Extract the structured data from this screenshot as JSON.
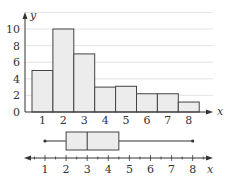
{
  "chart_data": [
    {
      "type": "bar",
      "subtype": "histogram",
      "title": "",
      "xlabel": "x",
      "ylabel": "y",
      "categories": [
        "1",
        "2",
        "3",
        "4",
        "5",
        "6",
        "7",
        "8"
      ],
      "values": [
        5,
        10,
        7,
        3,
        3.1,
        2.2,
        2.2,
        1.2
      ],
      "ylim": [
        0,
        12
      ],
      "yticks": [
        0,
        2,
        4,
        6,
        8,
        10
      ],
      "grid": true,
      "legend": null
    },
    {
      "type": "boxplot",
      "xlabel": "x",
      "min": 1,
      "q1": 2,
      "median": 3,
      "q3": 4.5,
      "max": 8,
      "xticks": [
        1,
        2,
        3,
        4,
        5,
        6,
        7,
        8
      ],
      "xlim": [
        0,
        8.8
      ]
    }
  ],
  "histogram": {
    "y_axis_label": "y",
    "x_axis_label": "x",
    "yticks": [
      "0",
      "2",
      "4",
      "6",
      "8",
      "10"
    ],
    "xticks": [
      "1",
      "2",
      "3",
      "4",
      "5",
      "6",
      "7",
      "8"
    ]
  },
  "boxplot": {
    "x_axis_label": "x",
    "xticks": [
      "1",
      "2",
      "3",
      "4",
      "5",
      "6",
      "7",
      "8"
    ]
  },
  "colors": {
    "bar_fill": "#ececec",
    "bar_stroke": "#444444",
    "grid": "#dddddd",
    "axis": "#333333"
  }
}
